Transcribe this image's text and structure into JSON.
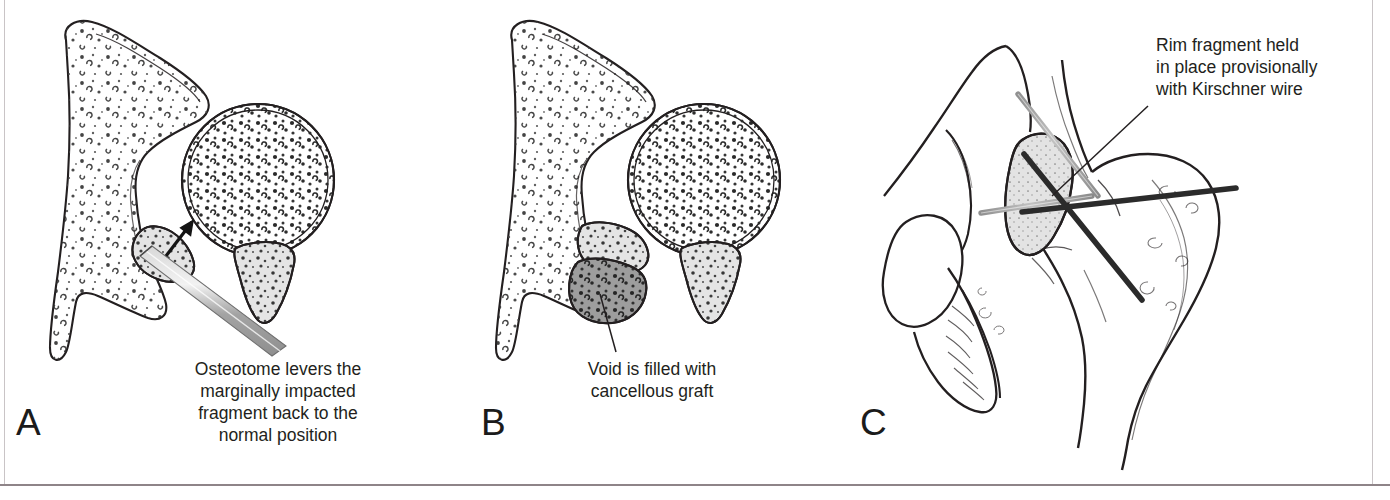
{
  "figure": {
    "background_color": "#ffffff",
    "frame_color": "#c9c4c6",
    "ink_color": "#231f20",
    "bone_fill": "#ffffff",
    "fragment_fill": "#e2e2e2",
    "graft_fill": "#9a9a9a",
    "metal_light": "#a8a8a8",
    "metal_dark": "#2b2b2b"
  },
  "panels": [
    {
      "id": "A",
      "label": "A",
      "label_x": 16,
      "label_y": 404,
      "caption": "Osteotome levers the\nmarginally impacted\nfragment back to the\nnormal position",
      "caption_x": 168,
      "caption_y": 358,
      "caption_width": 220,
      "caption_align": "center",
      "elements": [
        "pelvis-outline",
        "femoral-head",
        "impacted-fragment",
        "posterior-wall-fragment",
        "osteotome",
        "direction-arrow"
      ]
    },
    {
      "id": "B",
      "label": "B",
      "label_x": 481,
      "label_y": 404,
      "caption": "Void is filled with\ncancellous graft",
      "caption_x": 552,
      "caption_y": 358,
      "caption_width": 200,
      "caption_align": "center",
      "elements": [
        "pelvis-outline",
        "femoral-head",
        "reduced-fragment",
        "cancellous-graft",
        "posterior-wall-fragment",
        "leader-line"
      ]
    },
    {
      "id": "C",
      "label": "C",
      "label_x": 860,
      "label_y": 404,
      "caption": "Rim fragment held\nin place provisionally\nwith Kirschner wire",
      "caption_x": 1156,
      "caption_y": 34,
      "caption_width": 230,
      "caption_align": "left",
      "elements": [
        "hemipelvis-outline",
        "obturator-foramen",
        "ischiopubic-ramus",
        "proximal-femur",
        "greater-trochanter",
        "rim-fragment",
        "kirschner-wire-light-diagonal",
        "kirschner-wire-light-horizontal",
        "kirschner-wire-dark-diagonal",
        "kirschner-wire-dark-horizontal",
        "leader-line"
      ]
    }
  ]
}
